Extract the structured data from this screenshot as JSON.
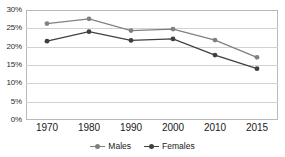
{
  "chart_data": {
    "type": "line",
    "title": "",
    "xlabel": "",
    "ylabel": "",
    "categories": [
      "1970",
      "1980",
      "1990",
      "2000",
      "2010",
      "2015"
    ],
    "ylim": [
      0,
      30
    ],
    "ytick_labels": [
      "0%",
      "5%",
      "10%",
      "15%",
      "20%",
      "25%",
      "30%"
    ],
    "ytick_values": [
      0,
      5,
      10,
      15,
      20,
      25,
      30
    ],
    "grid": "horizontal",
    "legend_position": "bottom",
    "series": [
      {
        "name": "Males",
        "color": "#808080",
        "marker": "circle",
        "values": [
          26.3,
          27.6,
          24.4,
          24.8,
          21.8,
          17.1
        ]
      },
      {
        "name": "Females",
        "color": "#404040",
        "marker": "circle",
        "values": [
          21.5,
          24.1,
          21.7,
          22.1,
          17.7,
          14.0
        ]
      }
    ]
  },
  "legend": {
    "items": [
      {
        "label": "Males"
      },
      {
        "label": "Females"
      }
    ]
  },
  "colors": {
    "males": "#808080",
    "females": "#404040",
    "gridline": "#d2d2d2",
    "border": "#b9b9b9",
    "background": "#ffffff",
    "axis_text": "#1a1a1a"
  }
}
